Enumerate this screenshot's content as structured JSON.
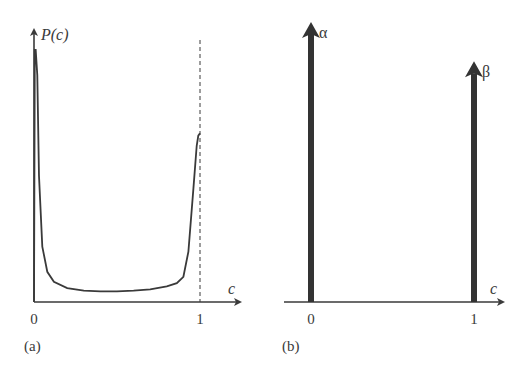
{
  "chart_data": [
    {
      "panel_label": "(a)",
      "type": "line",
      "title": "",
      "ylabel": "P(c)",
      "xlabel": "c",
      "x_ticks": [
        "0",
        "1"
      ],
      "xlim": [
        0,
        1.2
      ],
      "ylim": [
        0,
        1.05
      ],
      "marker_line": {
        "x": 1,
        "style": "dashed"
      },
      "series": [
        {
          "name": "P(c)",
          "x": [
            0.0,
            0.005,
            0.01,
            0.02,
            0.03,
            0.05,
            0.08,
            0.12,
            0.2,
            0.3,
            0.4,
            0.5,
            0.6,
            0.7,
            0.8,
            0.86,
            0.9,
            0.93,
            0.96,
            0.98,
            0.99,
            1.0
          ],
          "y": [
            0.0,
            1.0,
            1.0,
            0.9,
            0.5,
            0.22,
            0.12,
            0.08,
            0.055,
            0.045,
            0.042,
            0.042,
            0.045,
            0.05,
            0.062,
            0.075,
            0.1,
            0.2,
            0.45,
            0.62,
            0.66,
            0.67
          ]
        }
      ]
    },
    {
      "panel_label": "(b)",
      "type": "bar",
      "title": "",
      "xlabel": "c",
      "x_ticks": [
        "0",
        "1"
      ],
      "xlim": [
        -0.15,
        1.2
      ],
      "ylim": [
        0,
        1.05
      ],
      "series": [
        {
          "name": "α",
          "x": 0,
          "value": 1.0
        },
        {
          "name": "β",
          "x": 1,
          "value": 0.86
        }
      ]
    }
  ]
}
